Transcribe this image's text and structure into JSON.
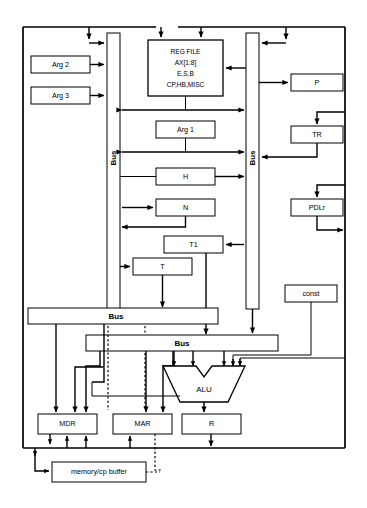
{
  "diagram": {
    "type": "block-diagram"
  },
  "registers": {
    "arg2": "Arg 2",
    "arg3": "Arg 3",
    "arg1": "Arg 1",
    "h": "H",
    "n": "N",
    "t1": "T1",
    "t": "T",
    "p": "P",
    "tr": "TR",
    "pdlr": "PDLr",
    "const": "const",
    "mdr": "MDR",
    "mar": "MAR",
    "r": "R"
  },
  "regfile": {
    "line1": "REG FILE",
    "line2": "AX[1:8]",
    "line3": "E,S,B",
    "line4": "CP,HB,MISC"
  },
  "buses": {
    "left_vertical": "Bus",
    "right_vertical": "Bus",
    "horizontal_upper": "Bus",
    "horizontal_lower": "Bus"
  },
  "alu": {
    "label": "ALU"
  },
  "memory": {
    "buffer": "memory/cp buffer"
  },
  "colors": {
    "line": "#000000",
    "fill": "#ffffff",
    "background": "#ffffff"
  }
}
